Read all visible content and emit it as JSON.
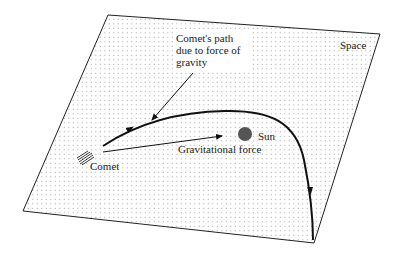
{
  "diagram": {
    "colors": {
      "plane_fill": "#ffffff",
      "dot": "#8a8a8a",
      "line": "#111111",
      "sun": "#555555"
    },
    "labels": {
      "space": "Space",
      "path_line1": "Comet's path",
      "path_line2": "due to force of",
      "path_line3": "gravity",
      "sun": "Sun",
      "force": "Gravitational force",
      "comet": "Comet"
    },
    "elements": {
      "plane": "dotted parallelogram representing space",
      "sun": "filled grey circle",
      "comet": "hatched comet glyph",
      "path": "curved trajectory with two direction arrows",
      "force_arrow": "straight arrow from comet toward sun",
      "leader_arrow": "pointer from path label to trajectory"
    }
  }
}
